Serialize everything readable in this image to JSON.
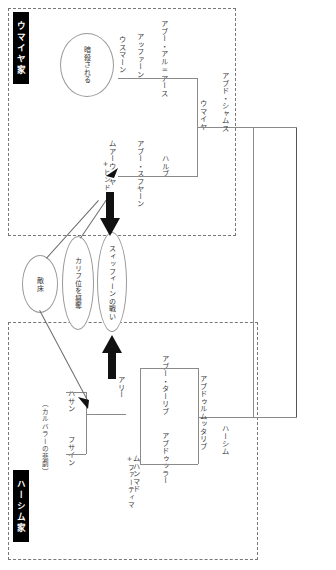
{
  "diagram": {
    "type": "genealogy-tree",
    "orientation": "rotated-90",
    "families": [
      {
        "id": "umayyad",
        "label": "ウマイヤ家"
      },
      {
        "id": "hashim",
        "label": "ハーシム家"
      }
    ],
    "persons": {
      "abd_shams": "アブド・シャムス",
      "umayya": "ウマイヤ",
      "abu_al_as": "アブー・アル=アース",
      "affan": "アッファーン",
      "uthman": "ウスマーン",
      "abu_sufyan": "アブー・スフヤーン",
      "harb": "ハルブ",
      "muawiya": "ムアーウィヤ",
      "hind": "+ヒンド",
      "hashim": "ハーシム",
      "abd_al_muttalib": "アブドゥルムッタリブ",
      "abu_talib": "アブー・ターリブ",
      "abdullah": "アブドゥッラー",
      "ali": "アリー",
      "muhammad": "ムハンマド",
      "hasan": "ハサン",
      "husayn": "フサイン",
      "fatima": "+ファーティマ"
    },
    "events": {
      "assassinated": "暗殺される",
      "usurp_caliphate": "カリフ位を簒奪",
      "siffin": "スィッフィーンの戦い",
      "hostility": "敵床",
      "karbala": "（カルバラーの悲劇）"
    },
    "colors": {
      "tag_bg": "#000000",
      "tag_fg": "#ffffff",
      "line": "#8a8a8a",
      "dash": "#777777",
      "arrow": "#111111"
    }
  }
}
